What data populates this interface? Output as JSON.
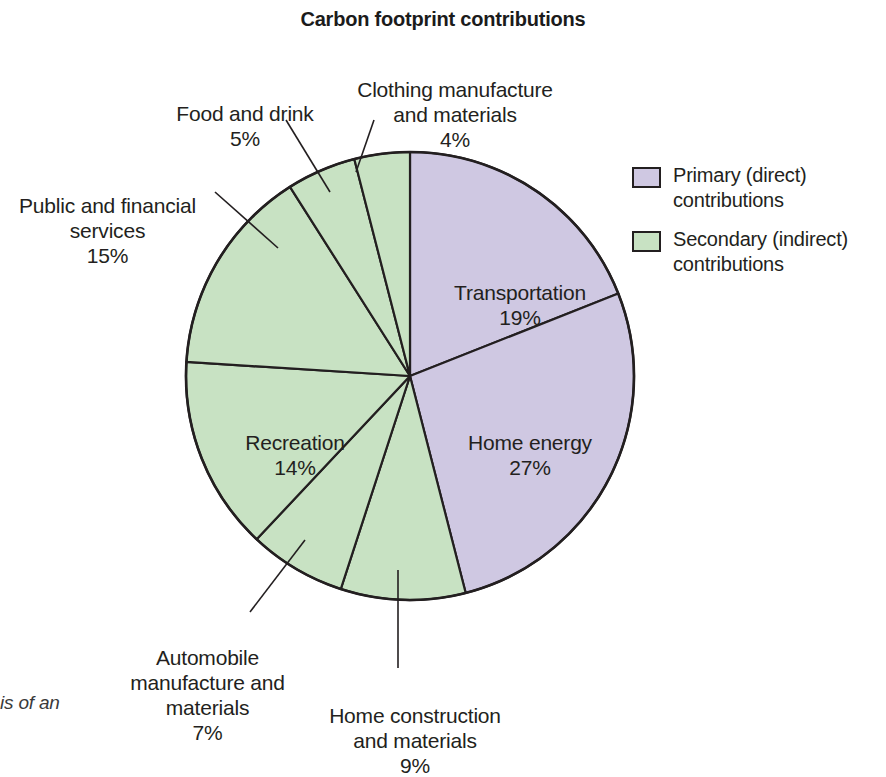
{
  "title": "Carbon footprint contributions",
  "caption_fragment": "is of an",
  "legend": {
    "items": [
      {
        "label": "Primary (direct)\ncontributions",
        "color": "#cfc8e2",
        "name": "primary-direct"
      },
      {
        "label": "Secondary (indirect)\ncontributions",
        "color": "#c8e2c3",
        "name": "secondary-indirect"
      }
    ]
  },
  "labels": {
    "food": {
      "name": "Food and drink",
      "pct": "5%"
    },
    "clothing": {
      "name": "Clothing manufacture\nand materials",
      "pct": "4%"
    },
    "public": {
      "name": "Public and financial\nservices",
      "pct": "15%"
    },
    "auto": {
      "name": "Automobile\nmanufacture and\nmaterials",
      "pct": "7%"
    },
    "homecon": {
      "name": "Home construction\nand materials",
      "pct": "9%"
    },
    "transport": {
      "name": "Transportation",
      "pct": "19%"
    },
    "homeenergy": {
      "name": "Home energy",
      "pct": "27%"
    },
    "recreation": {
      "name": "Recreation",
      "pct": "14%"
    }
  },
  "chart_data": {
    "type": "pie",
    "title": "Carbon footprint contributions",
    "unit": "percent",
    "total": 100,
    "start_angle_deg": -90,
    "direction": "clockwise",
    "legend_position": "right",
    "categories": [
      "Transportation",
      "Home energy",
      "Home construction and materials",
      "Automobile manufacture and materials",
      "Recreation",
      "Public and financial services",
      "Food and drink",
      "Clothing manufacture and materials"
    ],
    "values": [
      19,
      27,
      9,
      7,
      14,
      15,
      5,
      4
    ],
    "slices": [
      {
        "label": "Transportation",
        "value": 19,
        "group": "Primary (direct) contributions",
        "color": "#cfc8e2"
      },
      {
        "label": "Home energy",
        "value": 27,
        "group": "Primary (direct) contributions",
        "color": "#cfc8e2"
      },
      {
        "label": "Home construction and materials",
        "value": 9,
        "group": "Secondary (indirect) contributions",
        "color": "#c8e2c3"
      },
      {
        "label": "Automobile manufacture and materials",
        "value": 7,
        "group": "Secondary (indirect) contributions",
        "color": "#c8e2c3"
      },
      {
        "label": "Recreation",
        "value": 14,
        "group": "Secondary (indirect) contributions",
        "color": "#c8e2c3"
      },
      {
        "label": "Public and financial services",
        "value": 15,
        "group": "Secondary (indirect) contributions",
        "color": "#c8e2c3"
      },
      {
        "label": "Food and drink",
        "value": 5,
        "group": "Secondary (indirect) contributions",
        "color": "#c8e2c3"
      },
      {
        "label": "Clothing manufacture and materials",
        "value": 4,
        "group": "Secondary (indirect) contributions",
        "color": "#c8e2c3"
      }
    ],
    "groups": [
      {
        "name": "Primary (direct) contributions",
        "total": 46,
        "color": "#cfc8e2"
      },
      {
        "name": "Secondary (indirect) contributions",
        "total": 54,
        "color": "#c8e2c3"
      }
    ]
  }
}
